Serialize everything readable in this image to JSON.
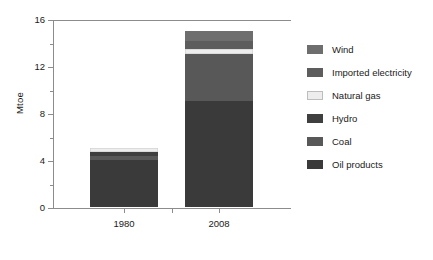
{
  "chart_data": {
    "type": "bar",
    "subtype": "stacked-vertical",
    "title": "",
    "xlabel": "",
    "ylabel": "Mtoe",
    "categories": [
      "1980",
      "2008"
    ],
    "ylim": [
      0,
      16
    ],
    "yticks": [
      0,
      4,
      8,
      12,
      16
    ],
    "ytick_labels": [
      "0",
      "4",
      "8",
      "12",
      "16"
    ],
    "yticks_minor": [
      2,
      6,
      10,
      14
    ],
    "grid": false,
    "legend_position": "right",
    "series": [
      {
        "name": "Wind",
        "color": "#6e6e6e",
        "values": [
          0.0,
          0.85
        ]
      },
      {
        "name": "Imported electricity",
        "color": "#5d5d5d",
        "values": [
          0.0,
          0.65
        ]
      },
      {
        "name": "Natural gas",
        "color": "#ededed",
        "values": [
          0.35,
          0.45
        ]
      },
      {
        "name": "Hydro",
        "color": "#3f3f3f",
        "values": [
          0.3,
          0.0
        ]
      },
      {
        "name": "Coal",
        "color": "#585858",
        "values": [
          0.35,
          4.0
        ]
      },
      {
        "name": "Oil products",
        "color": "#3a3a3a",
        "values": [
          4.0,
          9.0
        ]
      }
    ],
    "totals": [
      5.0,
      14.95
    ]
  },
  "legend": {
    "items": [
      {
        "label": "Wind"
      },
      {
        "label": "Imported electricity"
      },
      {
        "label": "Natural gas"
      },
      {
        "label": "Hydro"
      },
      {
        "label": "Coal"
      },
      {
        "label": "Oil products"
      }
    ]
  },
  "axis": {
    "y_title": "Mtoe",
    "y_labels": [
      "16",
      "12",
      "8",
      "4",
      "0"
    ],
    "x_labels": [
      "1980",
      "2008"
    ]
  },
  "colors": {
    "axis": "#8c8c8c",
    "text": "#1a1a1a",
    "background": "#ffffff"
  }
}
